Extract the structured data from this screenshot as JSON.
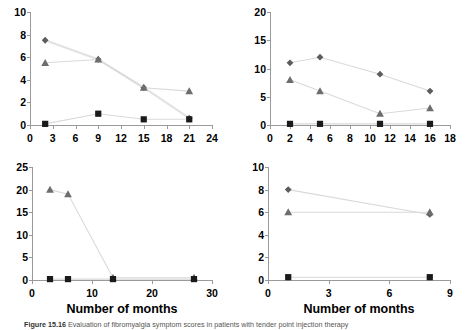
{
  "figure": {
    "caption_prefix": "Figure 15.16",
    "caption_text": "Evaluation of fibromyalgia symptom scores in patients with tender point injection therapy",
    "shared_xlabel": "Number of months"
  },
  "chart_data": [
    {
      "type": "scatter",
      "panel": "top-left",
      "title": "",
      "xlabel": "",
      "ylabel": "",
      "xlim": [
        0,
        24
      ],
      "ylim": [
        0,
        10
      ],
      "xticks": [
        0,
        3,
        6,
        9,
        12,
        15,
        18,
        21,
        24
      ],
      "yticks": [
        0,
        2,
        4,
        6,
        8,
        10
      ],
      "grid": false,
      "legend": "none",
      "series": [
        {
          "name": "diamond-series",
          "marker": "diamond",
          "color": "#5d5d5d",
          "x": [
            2,
            9,
            15,
            21
          ],
          "values": [
            7.5,
            5.8,
            3.3,
            0.6
          ]
        },
        {
          "name": "triangle-series",
          "marker": "triangle",
          "color": "#6d6d6d",
          "x": [
            2,
            9,
            15,
            21
          ],
          "values": [
            5.5,
            5.8,
            3.3,
            3.0
          ]
        },
        {
          "name": "square-series",
          "marker": "square",
          "color": "#1a1a1a",
          "x": [
            2,
            9,
            15,
            21
          ],
          "values": [
            0.1,
            1.0,
            0.5,
            0.5
          ]
        }
      ]
    },
    {
      "type": "scatter",
      "panel": "top-right",
      "title": "",
      "xlabel": "",
      "ylabel": "",
      "xlim": [
        0,
        18
      ],
      "ylim": [
        0,
        20
      ],
      "xticks": [
        0,
        2,
        4,
        6,
        8,
        10,
        12,
        14,
        16,
        18
      ],
      "yticks": [
        0,
        5,
        10,
        15,
        20
      ],
      "grid": false,
      "legend": "none",
      "series": [
        {
          "name": "diamond-series",
          "marker": "diamond",
          "color": "#5d5d5d",
          "x": [
            2,
            5,
            11,
            16
          ],
          "values": [
            11,
            12,
            9,
            6
          ]
        },
        {
          "name": "triangle-series",
          "marker": "triangle",
          "color": "#6d6d6d",
          "x": [
            2,
            5,
            11,
            16
          ],
          "values": [
            8,
            6,
            2,
            3
          ]
        },
        {
          "name": "square-series",
          "marker": "square",
          "color": "#1a1a1a",
          "x": [
            2,
            5,
            11,
            16
          ],
          "values": [
            0.2,
            0.2,
            0.2,
            0.2
          ]
        }
      ]
    },
    {
      "type": "scatter",
      "panel": "bottom-left",
      "title": "",
      "xlabel": "Number of months",
      "ylabel": "",
      "xlim": [
        0,
        30
      ],
      "ylim": [
        0,
        25
      ],
      "xticks": [
        0,
        10,
        20,
        30
      ],
      "yticks": [
        0,
        5,
        10,
        15,
        20,
        25
      ],
      "grid": false,
      "legend": "none",
      "series": [
        {
          "name": "triangle-series",
          "marker": "triangle",
          "color": "#6d6d6d",
          "x": [
            3,
            6,
            13.5,
            27
          ],
          "values": [
            20,
            19,
            0.5,
            0.5
          ]
        },
        {
          "name": "square-series",
          "marker": "square",
          "color": "#1a1a1a",
          "x": [
            3,
            6,
            13.5,
            27
          ],
          "values": [
            0.2,
            0.2,
            0.2,
            0.2
          ]
        }
      ]
    },
    {
      "type": "scatter",
      "panel": "bottom-right",
      "title": "",
      "xlabel": "Number of months",
      "ylabel": "",
      "xlim": [
        0,
        9
      ],
      "ylim": [
        0,
        10
      ],
      "xticks": [
        0,
        3,
        6,
        9
      ],
      "yticks": [
        0,
        2,
        4,
        6,
        8,
        10
      ],
      "grid": false,
      "legend": "none",
      "series": [
        {
          "name": "diamond-series",
          "marker": "diamond",
          "color": "#5d5d5d",
          "x": [
            1,
            8
          ],
          "values": [
            8,
            5.8
          ]
        },
        {
          "name": "triangle-series",
          "marker": "triangle",
          "color": "#6d6d6d",
          "x": [
            1,
            8
          ],
          "values": [
            6,
            6
          ]
        },
        {
          "name": "square-series",
          "marker": "square",
          "color": "#1a1a1a",
          "x": [
            1,
            8
          ],
          "values": [
            0.25,
            0.25
          ]
        }
      ]
    }
  ]
}
